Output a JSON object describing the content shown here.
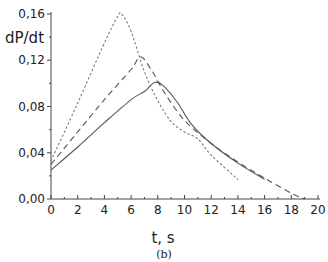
{
  "chart_data": {
    "type": "line",
    "title": "",
    "caption": "(b)",
    "xlabel": "t, s",
    "ylabel": "dP/dt",
    "xlim": [
      0,
      20
    ],
    "ylim": [
      0,
      0.16
    ],
    "x_ticks": [
      "0",
      "2",
      "4",
      "6",
      "8",
      "10",
      "12",
      "14",
      "16",
      "18",
      "20"
    ],
    "y_ticks": [
      "0,00",
      "0,04",
      "0,08",
      "0,12",
      "0,16"
    ],
    "grid": false,
    "legend": null,
    "series": [
      {
        "name": "solid",
        "style": "solid",
        "x": [
          0,
          2,
          4,
          6,
          7,
          7.8,
          8.5,
          9.5,
          10.5,
          12,
          14,
          16
        ],
        "values": [
          0.025,
          0.045,
          0.066,
          0.086,
          0.093,
          0.101,
          0.097,
          0.083,
          0.065,
          0.048,
          0.031,
          0.017
        ]
      },
      {
        "name": "dashed",
        "style": "dashed",
        "x": [
          0,
          2,
          4,
          6,
          6.7,
          7.5,
          8.5,
          10,
          12,
          14,
          16,
          18,
          19
        ],
        "values": [
          0.03,
          0.058,
          0.086,
          0.112,
          0.123,
          0.112,
          0.092,
          0.068,
          0.048,
          0.032,
          0.018,
          0.005,
          0.0
        ]
      },
      {
        "name": "dotted",
        "style": "dotted",
        "x": [
          0,
          2,
          4,
          5,
          5.3,
          6,
          7,
          8,
          9,
          10,
          11,
          12,
          14
        ],
        "values": [
          0.033,
          0.083,
          0.135,
          0.158,
          0.16,
          0.145,
          0.11,
          0.085,
          0.067,
          0.058,
          0.052,
          0.038,
          0.017
        ]
      }
    ]
  }
}
